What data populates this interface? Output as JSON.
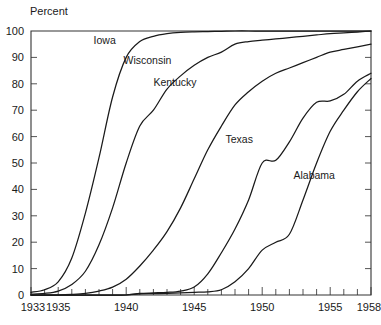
{
  "chart_data": {
    "type": "line",
    "title": "",
    "subtitle": "",
    "ylabel": "Percent",
    "xlabel": "",
    "xlim": [
      1933,
      1958
    ],
    "ylim": [
      0,
      100
    ],
    "grid": false,
    "legend_position": "inline-labels",
    "x_major_ticks": [
      1933,
      1935,
      1940,
      1945,
      1950,
      1955,
      1958
    ],
    "x_tick_labels": [
      "1933",
      "1935",
      "1940",
      "1945",
      "1950",
      "1955",
      "1958"
    ],
    "x_minor_tick_step": 1,
    "y_major_ticks": [
      0,
      10,
      20,
      30,
      40,
      50,
      60,
      70,
      80,
      90,
      100
    ],
    "y_tick_labels": [
      "0",
      "10",
      "20",
      "30",
      "40",
      "50",
      "60",
      "70",
      "80",
      "90",
      "100"
    ],
    "x": [
      1933,
      1934,
      1935,
      1936,
      1937,
      1938,
      1939,
      1940,
      1941,
      1942,
      1943,
      1944,
      1945,
      1946,
      1947,
      1948,
      1949,
      1950,
      1951,
      1952,
      1953,
      1954,
      1955,
      1956,
      1957,
      1958
    ],
    "series": [
      {
        "name": "Iowa",
        "label": "Iowa",
        "color": "#1a1a1a",
        "label_x": 1937.6,
        "label_y": 95.0,
        "values": [
          1,
          2,
          5,
          14,
          31,
          52,
          75,
          90,
          96,
          98,
          99,
          99.5,
          99.7,
          99.8,
          99.9,
          100,
          100,
          100,
          100,
          100,
          100,
          100,
          100,
          100,
          100,
          100
        ]
      },
      {
        "name": "Wisconsin",
        "label": "Wisconsin",
        "color": "#1a1a1a",
        "label_x": 1939.8,
        "label_y": 87.5,
        "values": [
          0.3,
          0.6,
          1.5,
          4,
          9,
          19,
          33,
          50,
          64,
          70,
          78,
          83,
          87,
          90,
          92,
          95,
          96,
          96.5,
          97,
          97.5,
          98,
          98.5,
          99,
          99.3,
          99.6,
          100
        ]
      },
      {
        "name": "Kentucky",
        "label": "Kentucky",
        "color": "#1a1a1a",
        "label_x": 1942.0,
        "label_y": 79.0,
        "values": [
          0,
          0,
          0,
          0.2,
          0.6,
          1.5,
          3,
          6,
          11,
          17,
          24,
          33,
          44,
          55,
          64,
          72,
          77,
          81,
          84,
          86,
          88,
          90,
          92,
          93,
          94,
          95
        ]
      },
      {
        "name": "Texas",
        "label": "Texas",
        "color": "#1a1a1a",
        "label_x": 1947.3,
        "label_y": 57.5,
        "values": [
          0,
          0,
          0,
          0,
          0,
          0,
          0,
          0,
          0.6,
          0.8,
          1,
          1.5,
          3,
          8,
          16,
          25,
          36,
          50,
          51,
          58,
          67,
          73,
          73.5,
          76,
          81,
          84
        ]
      },
      {
        "name": "Alabama",
        "label": "Alabama",
        "color": "#1a1a1a",
        "label_x": 1952.3,
        "label_y": 44.0,
        "values": [
          0,
          0,
          0,
          0,
          0,
          0,
          0,
          0,
          0.4,
          0.5,
          0.6,
          0.8,
          1,
          1.2,
          2,
          5,
          10,
          17,
          20,
          23,
          36,
          50,
          62,
          70,
          77,
          82
        ]
      }
    ]
  }
}
